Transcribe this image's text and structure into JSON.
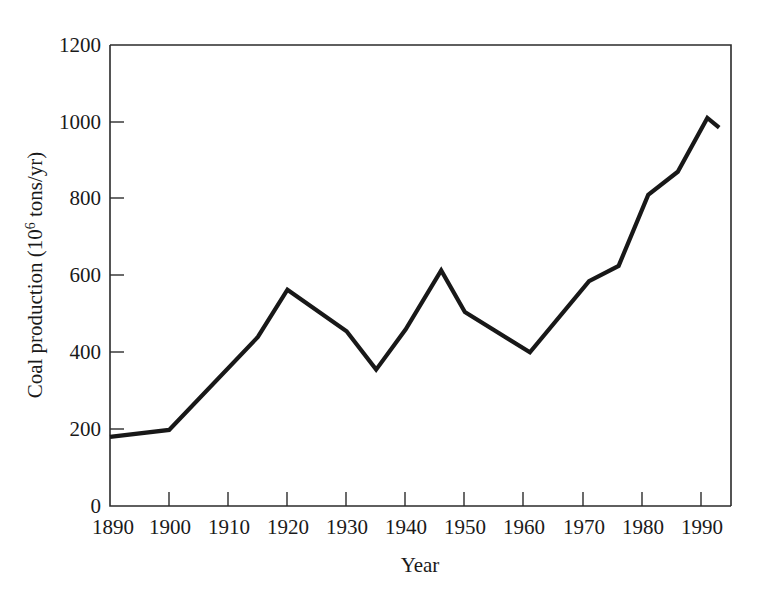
{
  "chart_data": {
    "type": "line",
    "title": "",
    "xlabel": "Year",
    "ylabel_prefix": "Coal production (10",
    "ylabel_sup": "6",
    "ylabel_suffix": " tons/yr)",
    "ylabel_full": "Coal production (10⁶ tons/yr)",
    "xlim": [
      1890,
      1995
    ],
    "ylim": [
      0,
      1200
    ],
    "grid": false,
    "legend": "none",
    "xticks": [
      1890,
      1900,
      1910,
      1920,
      1930,
      1940,
      1950,
      1960,
      1970,
      1980,
      1990
    ],
    "xtick_labels": [
      "1890",
      "1900",
      "1910",
      "1920",
      "1930",
      "1940",
      "1950",
      "1960",
      "1970",
      "1980",
      "1990"
    ],
    "yticks": [
      0,
      200,
      400,
      600,
      800,
      1000,
      1200
    ],
    "ytick_labels": [
      "0",
      "200",
      "400",
      "600",
      "800",
      "1000",
      "1200"
    ],
    "series": [
      {
        "name": "Coal production",
        "color": "#181818",
        "x": [
          1890,
          1900,
          1915,
          1920,
          1930,
          1935,
          1940,
          1946,
          1950,
          1961,
          1971,
          1976,
          1981,
          1986,
          1991,
          1993
        ],
        "values": [
          180,
          198,
          440,
          563,
          455,
          355,
          460,
          613,
          505,
          400,
          585,
          625,
          810,
          870,
          1010,
          985
        ]
      }
    ]
  }
}
